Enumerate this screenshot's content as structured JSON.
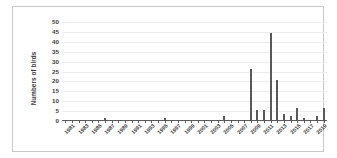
{
  "chart_data": {
    "type": "bar",
    "title": "",
    "xlabel": "",
    "ylabel": "Numbers of birds",
    "ylim": [
      0,
      50
    ],
    "yticks": [
      0,
      5,
      10,
      15,
      20,
      25,
      30,
      35,
      40,
      45,
      50
    ],
    "grid": true,
    "legend": "none",
    "bar_color": "#595959",
    "grid_color": "#ededed",
    "axis_color": "#595959",
    "categories": [
      1981,
      1982,
      1983,
      1984,
      1985,
      1986,
      1987,
      1988,
      1989,
      1990,
      1991,
      1992,
      1993,
      1994,
      1995,
      1996,
      1997,
      1998,
      1999,
      2000,
      2001,
      2002,
      2003,
      2004,
      2005,
      2006,
      2007,
      2008,
      2009,
      2010,
      2011,
      2012,
      2013,
      2014,
      2015,
      2016,
      2017,
      2018,
      2019,
      2020
    ],
    "values": [
      0,
      0,
      0,
      0,
      0,
      0,
      1,
      0,
      0,
      0,
      0,
      0,
      0,
      0,
      0,
      1,
      0,
      0,
      0,
      0,
      0,
      0,
      0,
      0,
      2,
      0,
      0,
      0,
      26,
      5,
      5,
      44,
      20,
      3,
      2,
      6,
      1,
      0,
      2,
      6
    ],
    "xtick_labels": [
      "1981",
      "1983",
      "1985",
      "1987",
      "1989",
      "1991",
      "1993",
      "1995",
      "1997",
      "1999",
      "2001",
      "2003",
      "2005",
      "2007",
      "2009",
      "2011",
      "2013",
      "2015",
      "2017",
      "2019"
    ],
    "xtick_label_years": [
      1981,
      1983,
      1985,
      1987,
      1989,
      1991,
      1993,
      1995,
      1997,
      1999,
      2001,
      2003,
      2005,
      2007,
      2009,
      2011,
      2013,
      2015,
      2017,
      2019
    ]
  }
}
